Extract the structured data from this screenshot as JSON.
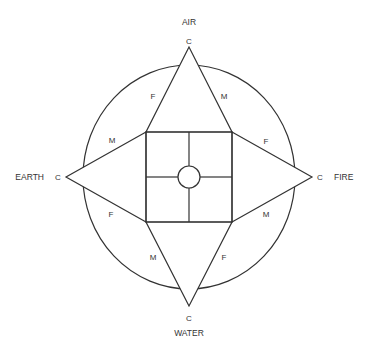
{
  "diagram": {
    "elements": {
      "top": "AIR",
      "left": "EARTH",
      "right": "FIRE",
      "bottom": "WATER"
    },
    "apex_labels": {
      "top": "C",
      "left": "C",
      "right": "C",
      "bottom": "C"
    },
    "segment_labels": {
      "top_left": "F",
      "top_right": "M",
      "left_upper": "M",
      "left_lower": "F",
      "right_upper": "F",
      "right_lower": "M",
      "bottom_left": "M",
      "bottom_right": "F"
    },
    "colors": {
      "line": "#333333",
      "background": "#ffffff"
    }
  }
}
